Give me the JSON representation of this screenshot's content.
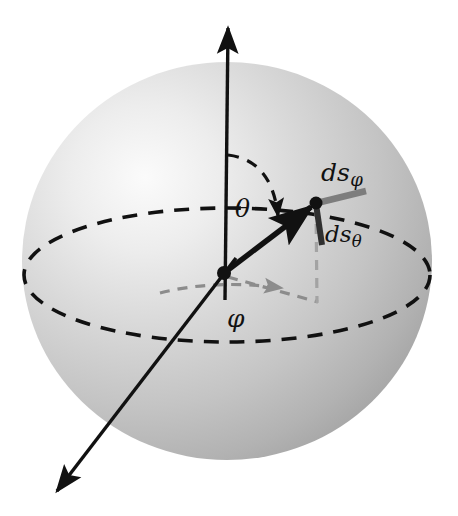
{
  "figure": {
    "background_color": "#ffffff",
    "sphere": {
      "fill_light": "#f2f2f2",
      "fill_mid": "#c9c9c9",
      "fill_dark": "#a8a8a8",
      "center_x": 227,
      "center_y": 261,
      "radius_x": 205,
      "radius_y": 199,
      "highlight_x": 130,
      "highlight_y": 175
    },
    "colors": {
      "stroke_black": "#111111",
      "stroke_gray": "#8c8c8c",
      "stroke_gray_light": "#9e9e9e",
      "ds_phi_color": "#7d7d7d",
      "ds_theta_color": "#3a3a3a"
    },
    "equator": {
      "name": "equatorial-circle",
      "style": "dashed",
      "center_x": 227,
      "center_y": 275,
      "radius_x": 203,
      "radius_y": 67
    },
    "origin": {
      "name": "origin-point",
      "x": 224,
      "y": 273
    },
    "surface_point": {
      "name": "surface-point",
      "x": 316,
      "y": 203
    },
    "foot_point": {
      "name": "projection-foot-point",
      "x": 316,
      "y": 300
    },
    "axes": [
      {
        "name": "z-axis",
        "from_x": 224,
        "from_y": 273,
        "to_x": 228,
        "to_y": 22,
        "arrow": "end"
      },
      {
        "name": "x-axis",
        "from_x": 224,
        "from_y": 273,
        "to_x": 52,
        "to_y": 497,
        "arrow": "end"
      }
    ],
    "radius_vector": {
      "name": "radius-vector",
      "from_x": 224,
      "from_y": 273,
      "to_x": 316,
      "to_y": 203
    },
    "tangent_vectors": [
      {
        "name": "ds-phi-segment",
        "from_x": 316,
        "from_y": 203,
        "to_x": 364,
        "to_y": 191,
        "color": "#7d7d7d"
      },
      {
        "name": "ds-theta-segment",
        "from_x": 316,
        "from_y": 203,
        "to_x": 321,
        "to_y": 243,
        "color": "#3a3a3a"
      }
    ],
    "labels": {
      "ds_phi": {
        "base": "ds",
        "subscript": "φ"
      },
      "ds_theta": {
        "base": "ds",
        "subscript": "θ"
      },
      "theta": "θ",
      "phi": "φ"
    },
    "angle_arcs": [
      {
        "name": "theta-arc",
        "symbol": "θ",
        "style": "dashed",
        "color": "#111111",
        "description": "polar angle from z-axis to radius vector"
      },
      {
        "name": "phi-arc",
        "symbol": "φ",
        "style": "dashed",
        "color": "#8c8c8c",
        "description": "azimuthal angle in equatorial plane"
      }
    ],
    "projection_lines": [
      {
        "name": "vertical-drop-line",
        "style": "dashed",
        "color": "#9e9e9e",
        "from_x": 316,
        "from_y": 205,
        "to_x": 316,
        "to_y": 302
      },
      {
        "name": "radial-projection-line",
        "style": "dashed",
        "color": "#8c8c8c",
        "from_x": 226,
        "from_y": 276,
        "to_x": 316,
        "to_y": 301
      }
    ]
  }
}
